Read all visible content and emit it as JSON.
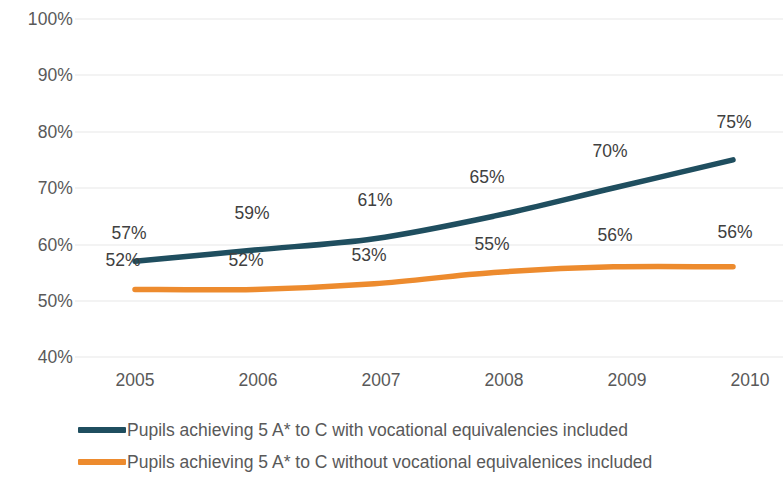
{
  "chart_data": {
    "type": "line",
    "title": "",
    "xlabel": "",
    "ylabel": "",
    "categories": [
      "2005",
      "2006",
      "2007",
      "2008",
      "2009",
      "2010"
    ],
    "ylim": [
      40,
      100
    ],
    "y_ticks": [
      "40%",
      "50%",
      "60%",
      "70%",
      "80%",
      "90%",
      "100%"
    ],
    "y_tick_values": [
      40,
      50,
      60,
      70,
      80,
      90,
      100
    ],
    "grid": true,
    "legend_position": "bottom",
    "series": [
      {
        "name": "Pupils achieving 5 A* to C with vocational equivalencies included",
        "color": "#1F4E5F",
        "values": [
          57,
          59,
          61,
          65,
          70,
          75
        ],
        "labels": [
          "57%",
          "59%",
          "61%",
          "65%",
          "70%",
          "75%"
        ]
      },
      {
        "name": "Pupils achieving 5 A* to C without vocational equivalenices included",
        "color": "#ED8B2E",
        "values": [
          52,
          52,
          53,
          55,
          56,
          56
        ],
        "labels": [
          "52%",
          "52%",
          "53%",
          "55%",
          "56%",
          "56%"
        ]
      }
    ]
  },
  "axis": {
    "y_ticks": [
      {
        "label": "100%"
      },
      {
        "label": "90%"
      },
      {
        "label": "80%"
      },
      {
        "label": "70%"
      },
      {
        "label": "60%"
      },
      {
        "label": "50%"
      },
      {
        "label": "40%"
      }
    ],
    "x_ticks": [
      {
        "label": "2005"
      },
      {
        "label": "2006"
      },
      {
        "label": "2007"
      },
      {
        "label": "2008"
      },
      {
        "label": "2009"
      },
      {
        "label": "2010"
      }
    ]
  },
  "labels": {
    "blue": [
      "57%",
      "59%",
      "61%",
      "65%",
      "70%",
      "75%"
    ],
    "orange": [
      "52%",
      "52%",
      "53%",
      "55%",
      "56%",
      "56%"
    ]
  },
  "legend": {
    "items": [
      {
        "label": "Pupils achieving 5 A* to C with vocational equivalencies included",
        "color": "#1F4E5F"
      },
      {
        "label": "Pupils achieving 5 A* to C without vocational equivalenices included",
        "color": "#ED8B2E"
      }
    ]
  },
  "colors": {
    "series_blue": "#1F4E5F",
    "series_orange": "#ED8B2E",
    "gridline": "#E8E8E8",
    "tick_text": "#595959",
    "label_text": "#404040",
    "background": "#FFFFFF"
  }
}
